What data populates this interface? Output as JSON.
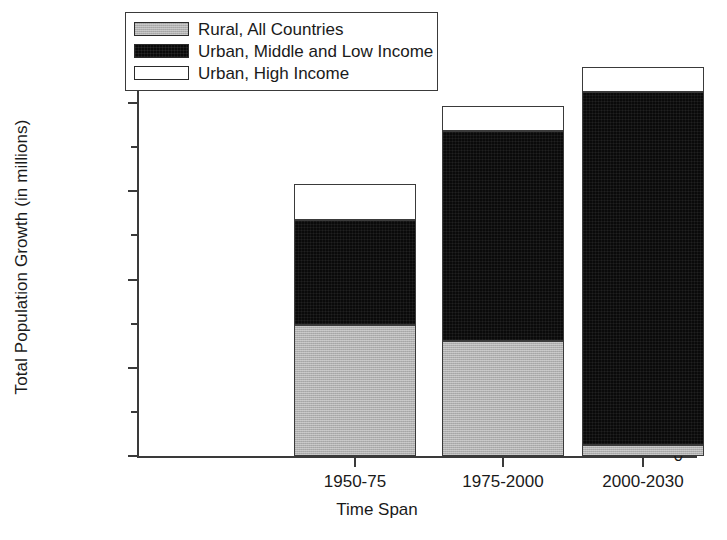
{
  "chart_data": {
    "type": "bar",
    "subtype": "stacked",
    "title": "",
    "xlabel": "Time Span",
    "ylabel": "Total Population Growth (in millions)",
    "categories": [
      "1950-75",
      "1975-2000",
      "2000-2030"
    ],
    "ylim": [
      0,
      2250
    ],
    "yticks": [
      0,
      500,
      1000,
      1500,
      2000
    ],
    "ytick_labels": [
      "0",
      "500",
      "1000",
      "1500",
      "2000"
    ],
    "yminor_ticks": [
      250,
      750,
      1250,
      1750,
      2250
    ],
    "grid": false,
    "legend_position": "upper left",
    "series": [
      {
        "name": "Rural, All Countries",
        "color": "#b0b0b0",
        "fill": "gray",
        "values": [
          740,
          650,
          65
        ]
      },
      {
        "name": "Urban, Middle and Low Income",
        "color": "#0a0a0a",
        "fill": "black",
        "values": [
          595,
          1190,
          2000
        ]
      },
      {
        "name": "Urban, High Income",
        "color": "#ffffff",
        "fill": "white",
        "values": [
          205,
          145,
          140
        ]
      }
    ],
    "totals": [
      1540,
      1985,
      2205
    ]
  },
  "axes": {
    "y_title": "Total Population Growth (in millions)",
    "x_title": "Time Span",
    "y_tick_labels": [
      "2000",
      "1500",
      "1000",
      "500",
      "0"
    ],
    "x_tick_labels": [
      "1950-75",
      "1975-2000",
      "2000-2030"
    ]
  },
  "legend": {
    "items": [
      {
        "label": "Rural, All Countries",
        "swatch": "gray-swatch"
      },
      {
        "label": "Urban, Middle and Low Income",
        "swatch": "black-swatch"
      },
      {
        "label": "Urban, High Income",
        "swatch": "white-swatch"
      }
    ]
  },
  "colors": {
    "rural": "#b0b0b0",
    "urban_middle_low": "#0a0a0a",
    "urban_high": "#ffffff",
    "axis": "#3a3a3a",
    "background": "#ffffff"
  }
}
